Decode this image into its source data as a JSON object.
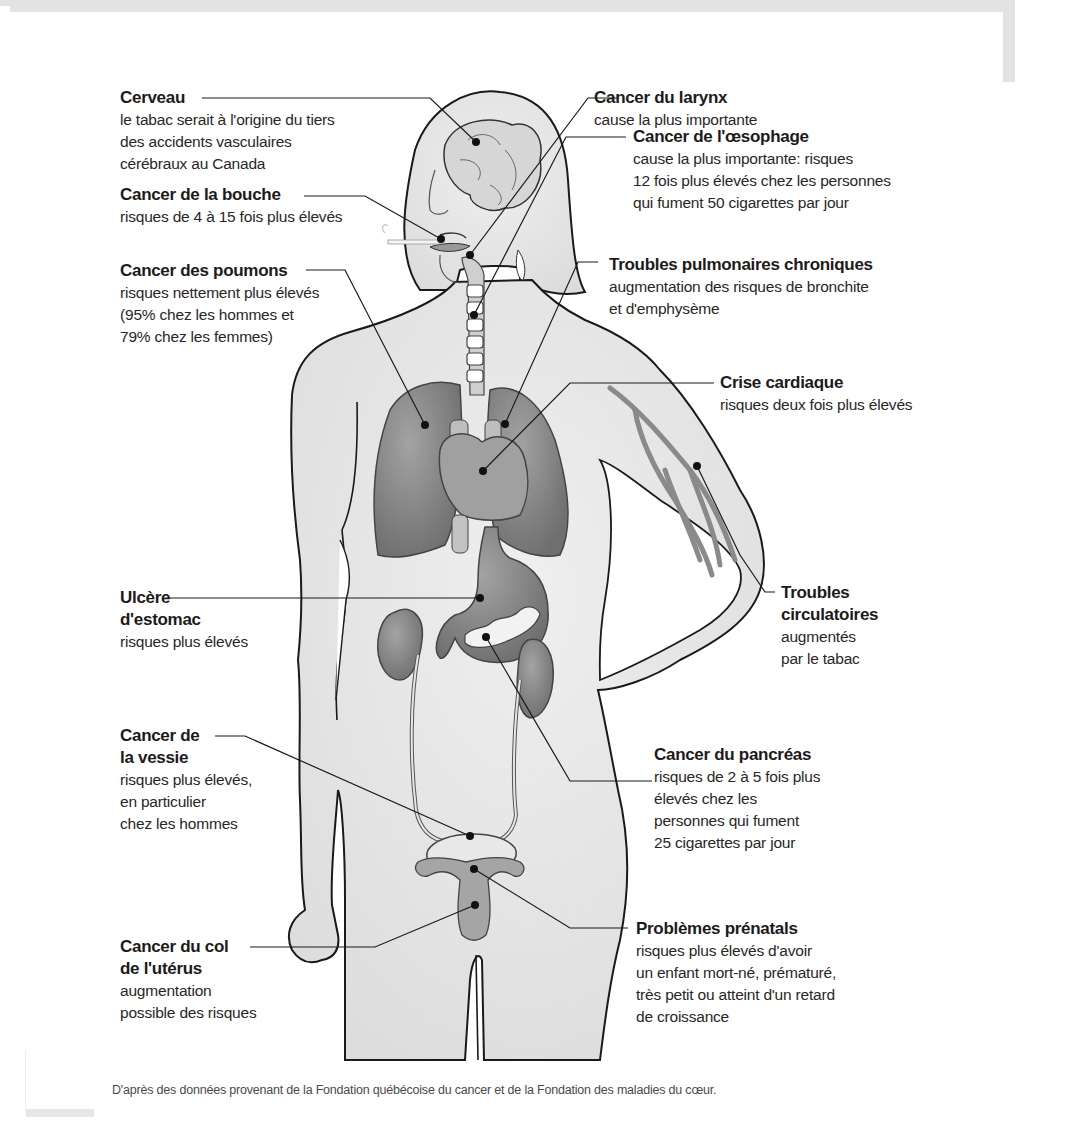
{
  "diagram": {
    "labels": {
      "cerveau": {
        "title": "Cerveau",
        "desc": "le tabac serait à l'origine du tiers\ndes accidents vasculaires\ncérébraux au Canada"
      },
      "bouche": {
        "title": "Cancer de la bouche",
        "desc": "risques de 4 à 15 fois plus élevés"
      },
      "poumons": {
        "title": "Cancer des poumons",
        "desc": "risques nettement plus élevés\n(95% chez les hommes et\n79% chez les femmes)"
      },
      "larynx": {
        "title": "Cancer du larynx",
        "desc": "cause la plus importante"
      },
      "oesophage": {
        "title": "Cancer de l'œsophage",
        "desc": "cause la plus importante: risques\n12 fois plus élevés chez les personnes\nqui fument 50 cigarettes par jour"
      },
      "pulmonaires": {
        "title": "Troubles pulmonaires chroniques",
        "desc": "augmentation des risques de bronchite\net d'emphysème"
      },
      "cardiaque": {
        "title": "Crise cardiaque",
        "desc": "risques deux fois plus élevés"
      },
      "ulcere": {
        "title": "Ulcère\nd'estomac",
        "desc": "risques plus élevés"
      },
      "circulatoires": {
        "title": "Troubles\ncirculatoires",
        "desc": "augmentés\npar le tabac"
      },
      "vessie": {
        "title": "Cancer de\nla vessie",
        "desc": "risques plus élevés,\nen particulier\nchez les hommes"
      },
      "pancreas": {
        "title": "Cancer du pancréas",
        "desc": "risques de 2 à 5 fois plus\nélevés chez les\npersonnes qui fument\n25 cigarettes par jour"
      },
      "col_uterus": {
        "title": "Cancer du col\nde l'utérus",
        "desc": "augmentation\npossible des risques"
      },
      "prenatals": {
        "title": "Problèmes prénatals",
        "desc": "risques plus élevés d'avoir\nun enfant mort-né, prématuré,\ntrès petit ou atteint d'un retard\nde croissance"
      }
    },
    "footnote": "D'après des données provenant de la Fondation québécoise du cancer et de la Fondation des maladies du cœur."
  },
  "colors": {
    "skin": "#e6e6e6",
    "organ": "#8a8a8a",
    "organ_light": "#a8a8a8",
    "outline": "#1a1a1a",
    "frame": "#e3e3e3"
  }
}
